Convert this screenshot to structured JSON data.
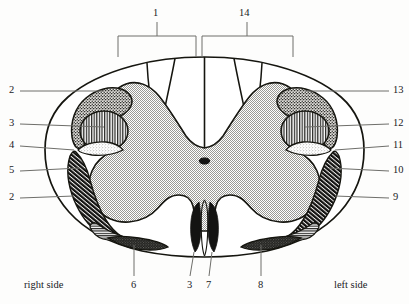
{
  "figure": {
    "type": "anatomical-cross-section-diagram",
    "orientation_labels": {
      "left_text": "right side",
      "right_text": "left side"
    },
    "brackets": [
      {
        "id": "bracket-1",
        "label": "1",
        "side": "right-half-of-image-left-column",
        "x_start": 118,
        "x_end": 196,
        "y": 36,
        "stem_x": 157,
        "stem_top": 22
      },
      {
        "id": "bracket-14",
        "label": "14",
        "x_start": 202,
        "x_end": 293,
        "y": 36,
        "stem_x": 247,
        "stem_top": 22
      }
    ],
    "left_labels": [
      {
        "label": "2",
        "y": 91,
        "leader_to_x": 104,
        "leader_to_y": 91
      },
      {
        "label": "3",
        "y": 124,
        "leader_to_x": 76,
        "leader_to_y": 124
      },
      {
        "label": "4",
        "y": 144,
        "leader_to_x": 64,
        "leader_to_y": 148
      },
      {
        "label": "5",
        "y": 171,
        "leader_to_x": 78,
        "leader_to_y": 168
      },
      {
        "label": "2",
        "y": 198,
        "leader_to_x": 72,
        "leader_to_y": 196
      }
    ],
    "right_labels": [
      {
        "label": "13",
        "y": 91,
        "leader_to_x": 305,
        "leader_to_y": 91
      },
      {
        "label": "12",
        "y": 124,
        "leader_to_x": 333,
        "leader_to_y": 128
      },
      {
        "label": "11",
        "y": 144,
        "leader_to_x": 345,
        "leader_to_y": 148
      },
      {
        "label": "10",
        "y": 171,
        "leader_to_x": 330,
        "leader_to_y": 167
      },
      {
        "label": "9",
        "y": 198,
        "leader_to_x": 337,
        "leader_to_y": 196
      }
    ],
    "bottom_labels": [
      {
        "label": "6",
        "x": 134,
        "leader_from_y": 247,
        "leader_to_y": 278
      },
      {
        "label": "3",
        "x": 190,
        "leader_from_y": 252,
        "leader_to_y": 278
      },
      {
        "label": "7",
        "x": 209,
        "leader_from_y": 252,
        "leader_to_y": 278
      },
      {
        "label": "8",
        "x": 261,
        "leader_from_y": 247,
        "leader_to_y": 278
      }
    ],
    "regions": [
      {
        "name": "gray-matter-butterfly",
        "fill": "stipple-gray",
        "color": "#b8b8b4"
      },
      {
        "name": "white-matter-background",
        "fill": "solid-white",
        "color": "#ffffff"
      },
      {
        "name": "dorsal-tract-stipple-dark-left",
        "fill": "stipple-dark",
        "color": "#4a4a46"
      },
      {
        "name": "dorsal-tract-stipple-dark-right",
        "fill": "stipple-dark",
        "color": "#4a4a46"
      },
      {
        "name": "lateral-oval-vertical-stripe-left",
        "fill": "vertical-stripe",
        "color": "#2e2e2b"
      },
      {
        "name": "lateral-oval-vertical-stripe-right",
        "fill": "vertical-stripe",
        "color": "#2e2e2b"
      },
      {
        "name": "small-light-stipple-left",
        "fill": "stipple-light",
        "color": "#d9d7d2"
      },
      {
        "name": "small-light-stipple-right",
        "fill": "stipple-light",
        "color": "#d9d7d2"
      },
      {
        "name": "anterolateral-hatch-left",
        "fill": "diagonal-hatch",
        "color": "#1c1c1a"
      },
      {
        "name": "anterolateral-hatch-right",
        "fill": "diagonal-hatch",
        "color": "#1c1c1a"
      },
      {
        "name": "horizontal-stripe-band-left",
        "fill": "horizontal-stripe",
        "color": "#242422"
      },
      {
        "name": "horizontal-stripe-band-right",
        "fill": "horizontal-stripe",
        "color": "#242422"
      },
      {
        "name": "ventral-dark-patch-left",
        "fill": "stipple-verydark",
        "color": "#30302d"
      },
      {
        "name": "ventral-dark-patch-right",
        "fill": "stipple-verydark",
        "color": "#30302d"
      },
      {
        "name": "anterior-fissure-dark-left",
        "fill": "solid-dark",
        "color": "#131312"
      },
      {
        "name": "anterior-fissure-dark-right",
        "fill": "solid-dark",
        "color": "#131312"
      },
      {
        "name": "central-canal",
        "fill": "solid-dark",
        "color": "#131312"
      }
    ]
  }
}
